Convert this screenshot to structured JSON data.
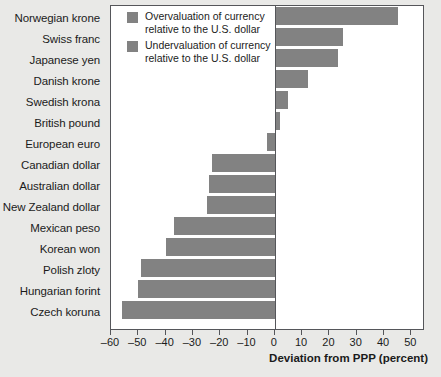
{
  "chart_data": {
    "type": "bar",
    "orientation": "horizontal",
    "title": "",
    "xlabel": "Deviation from PPP (percent)",
    "ylabel": "",
    "xlim": [
      -60,
      55
    ],
    "xticks": [
      -60,
      -50,
      -40,
      -30,
      -20,
      -10,
      0,
      10,
      20,
      30,
      40,
      50
    ],
    "xtick_labels": [
      "–60",
      "–50",
      "–40",
      "–30",
      "–20",
      "–10",
      "0",
      "10",
      "20",
      "30",
      "40",
      "50"
    ],
    "grid": false,
    "legend_position": "top-left-inside",
    "categories": [
      "Norwegian krone",
      "Swiss franc",
      "Japanese yen",
      "Danish krone",
      "Swedish krona",
      "British pound",
      "European euro",
      "Canadian dollar",
      "Australian dollar",
      "New Zealand dollar",
      "Mexican peso",
      "Korean won",
      "Polish zloty",
      "Hungarian forint",
      "Czech koruna"
    ],
    "values": [
      45,
      25,
      23,
      12,
      5,
      2,
      -3,
      -23,
      -24,
      -25,
      -37,
      -40,
      -49,
      -50,
      -56
    ],
    "series": [
      {
        "name": "Deviation from PPP",
        "values": [
          45,
          25,
          23,
          12,
          5,
          2,
          -3,
          -23,
          -24,
          -25,
          -37,
          -40,
          -49,
          -50,
          -56
        ]
      }
    ],
    "legend": [
      {
        "swatch_color": "#828282",
        "line1": "Overvaluation of currency",
        "line2": "relative to the U.S. dollar"
      },
      {
        "swatch_color": "#828282",
        "line1": "Undervaluation of currency",
        "line2": "relative to the U.S. dollar"
      }
    ],
    "colors": {
      "bar": "#828282",
      "frame": "#55565a",
      "plot_background": "#ffffff",
      "page_background": "#e9e9e7",
      "text": "#1b1b1b"
    }
  }
}
